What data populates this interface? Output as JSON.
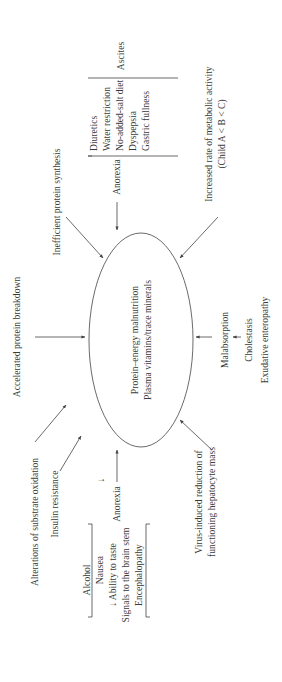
{
  "center": {
    "line1": "Protein–energy malnutrition",
    "line2": "Plasma vitamins/trace minerals"
  },
  "causes": {
    "accelerated_breakdown": "Accelerated protein breakdown",
    "inefficient_synthesis": "Inefficient protein synthesis",
    "substrate_oxidation": "Alterations of substrate oxidation",
    "insulin_resistance": "Insulin resistance",
    "metabolic_activity_line1": "Increased rate of metabolic activity",
    "metabolic_activity_line2": "(Child A < B < C)",
    "virus_line1": "Virus-induced reduction of",
    "virus_line2": "functioning hepatocyte mass",
    "malabsorption": "Malabsorption",
    "cholestasis": "Cholestasis",
    "exudative": "Exudative enteropathy"
  },
  "left_anorexia": {
    "label": "Anorexia",
    "down_arrow": "↓",
    "items": [
      "Alcohol",
      "Nausea",
      "↓ Ability to taste",
      "Signals to the brain stem",
      "Encephalopathy"
    ]
  },
  "right_anorexia": {
    "label": "Anorexia",
    "items": [
      "Diuretics",
      "Water restriction",
      "No-added-salt diet",
      "Dyspepsia",
      "Gastric fullness"
    ],
    "group_label": "Ascites"
  }
}
